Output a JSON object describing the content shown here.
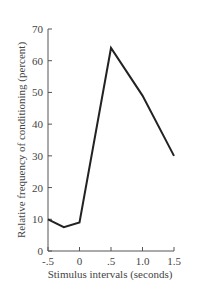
{
  "chart_data": {
    "type": "line",
    "title": "",
    "xlabel": "Stimulus intervals (seconds)",
    "ylabel": "Relative frequency of conditioning (percent)",
    "x": [
      -0.5,
      -0.25,
      0,
      0.5,
      1.0,
      1.5
    ],
    "series": [
      {
        "name": "Conditioning",
        "values": [
          10,
          7.5,
          9,
          64,
          49,
          30
        ]
      }
    ],
    "xticks": [
      "-.5",
      "0",
      ".5",
      "1.0",
      "1.5"
    ],
    "xtick_values": [
      -0.5,
      0,
      0.5,
      1.0,
      1.5
    ],
    "yticks": [
      "0",
      "10",
      "20",
      "30",
      "40",
      "50",
      "60",
      "70"
    ],
    "ytick_values": [
      0,
      10,
      20,
      30,
      40,
      50,
      60,
      70
    ],
    "xlim": [
      -0.5,
      1.5
    ],
    "ylim": [
      0,
      70
    ],
    "grid": false,
    "legend": "none",
    "line_color": "#222222"
  }
}
